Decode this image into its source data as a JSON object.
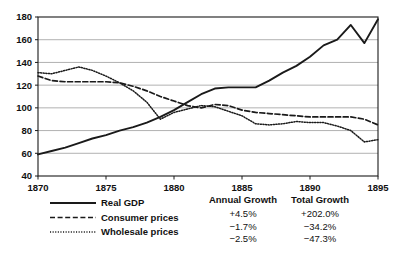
{
  "chart_data": {
    "type": "line",
    "title": "",
    "xlabel": "",
    "ylabel": "",
    "xlim": [
      1870,
      1895
    ],
    "ylim": [
      40,
      180
    ],
    "grid": true,
    "y_ticks": [
      40,
      60,
      80,
      100,
      120,
      140,
      160,
      180
    ],
    "x_ticks": [
      1870,
      1875,
      1880,
      1885,
      1890,
      1895
    ],
    "x": [
      1870,
      1871,
      1872,
      1873,
      1874,
      1875,
      1876,
      1877,
      1878,
      1879,
      1880,
      1881,
      1882,
      1883,
      1884,
      1885,
      1886,
      1887,
      1888,
      1889,
      1890,
      1891,
      1892,
      1893,
      1894,
      1895
    ],
    "legend_position": "below-left",
    "series": [
      {
        "name": "Real GDP",
        "style": "solid",
        "color": "#1a1a1a",
        "values": [
          59,
          62,
          65,
          69,
          73,
          76,
          80,
          83,
          87,
          92,
          98,
          105,
          112,
          117,
          118,
          118,
          118,
          124,
          131,
          137,
          145,
          155,
          160,
          173,
          157,
          178
        ]
      },
      {
        "name": "Consumer prices",
        "style": "dashed",
        "color": "#1a1a1a",
        "values": [
          128,
          124,
          123,
          123,
          123,
          123,
          122,
          119,
          115,
          110,
          106,
          102,
          100,
          103,
          102,
          98,
          96,
          95,
          94,
          93,
          92,
          92,
          92,
          92,
          90,
          85
        ]
      },
      {
        "name": "Wholesale prices",
        "style": "dotted",
        "color": "#1a1a1a",
        "values": [
          131,
          130,
          133,
          136,
          133,
          128,
          122,
          115,
          105,
          90,
          96,
          99,
          102,
          101,
          97,
          93,
          86,
          85,
          86,
          88,
          87,
          87,
          84,
          80,
          70,
          72
        ]
      }
    ],
    "legend": [
      {
        "label": "Real GDP",
        "style": "solid"
      },
      {
        "label": "Consumer prices",
        "style": "dashed"
      },
      {
        "label": "Wholesale prices",
        "style": "dotted"
      }
    ],
    "annotations": {
      "columns": [
        "Annual Growth",
        "Total Growth"
      ],
      "rows": [
        {
          "series": "Real GDP",
          "annual_growth": "+4.5%",
          "total_growth": "+202.0%"
        },
        {
          "series": "Consumer prices",
          "annual_growth": "−1.7%",
          "total_growth": "−34.2%"
        },
        {
          "series": "Wholesale prices",
          "annual_growth": "−2.5%",
          "total_growth": "−47.3%"
        }
      ]
    },
    "colors": {
      "axis": "#1a1a1a",
      "gridline": "#a8a8a8",
      "background": "#ffffff",
      "text": "#111111"
    }
  }
}
